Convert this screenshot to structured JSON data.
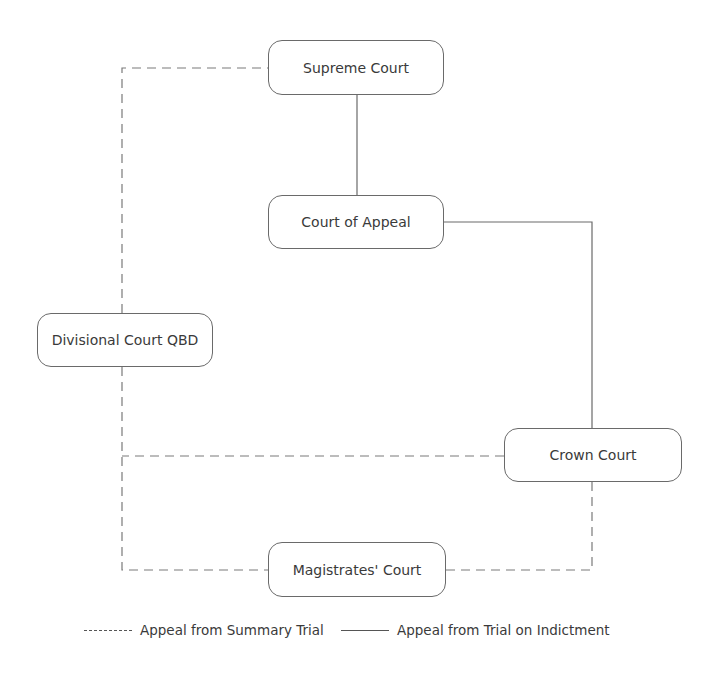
{
  "diagram": {
    "nodes": [
      {
        "id": "supreme",
        "label": "Supreme Court"
      },
      {
        "id": "appeal",
        "label": "Court of Appeal"
      },
      {
        "id": "divisional",
        "label": "Divisional Court QBD"
      },
      {
        "id": "crown",
        "label": "Crown Court"
      },
      {
        "id": "magistrates",
        "label": "Magistrates' Court"
      }
    ],
    "edges": [
      {
        "from": "appeal",
        "to": "supreme",
        "style": "solid"
      },
      {
        "from": "crown",
        "to": "appeal",
        "style": "solid"
      },
      {
        "from": "divisional",
        "to": "supreme",
        "style": "dashed"
      },
      {
        "from": "crown",
        "to": "divisional",
        "style": "dashed"
      },
      {
        "from": "magistrates",
        "to": "divisional",
        "style": "dashed"
      },
      {
        "from": "magistrates",
        "to": "crown",
        "style": "dashed"
      }
    ],
    "line_color": "#6a6a6a"
  },
  "legend": {
    "dashed_label": "Appeal from Summary Trial",
    "solid_label": "Appeal from Trial on Indictment"
  }
}
